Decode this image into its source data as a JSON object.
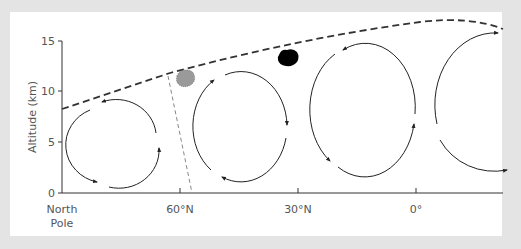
{
  "diagram": {
    "y_axis": {
      "label": "Altitude (km)",
      "ticks": [
        {
          "label": "0",
          "value": 0
        },
        {
          "label": "5",
          "value": 5
        },
        {
          "label": "10",
          "value": 10
        },
        {
          "label": "15",
          "value": 15
        }
      ]
    },
    "x_axis": {
      "ticks": [
        {
          "label_line1": "North",
          "label_line2": "Pole"
        },
        {
          "label_line1": "60°N"
        },
        {
          "label_line1": "30°N"
        },
        {
          "label_line1": "0°"
        }
      ]
    },
    "elements": {
      "tropopause": "dashed-boundary-line",
      "polar_front": "gray-dashed-line",
      "gray_blob": "polar-jet-stream",
      "black_blob": "subtropical-jet-stream",
      "cells": [
        {
          "name": "polar-cell",
          "direction": "counterclockwise"
        },
        {
          "name": "ferrel-cell",
          "direction": "clockwise"
        },
        {
          "name": "hadley-cell",
          "direction": "counterclockwise"
        },
        {
          "name": "southern-hadley-cell",
          "direction": "clockwise"
        }
      ]
    },
    "colors": {
      "background": "#e4e4e4",
      "panel": "#ffffff",
      "axis": "#333333",
      "text": "#555555",
      "tropopause": "#333333",
      "front": "#888888",
      "gray_blob": "#9a9a9a",
      "black_blob": "#000000"
    }
  }
}
